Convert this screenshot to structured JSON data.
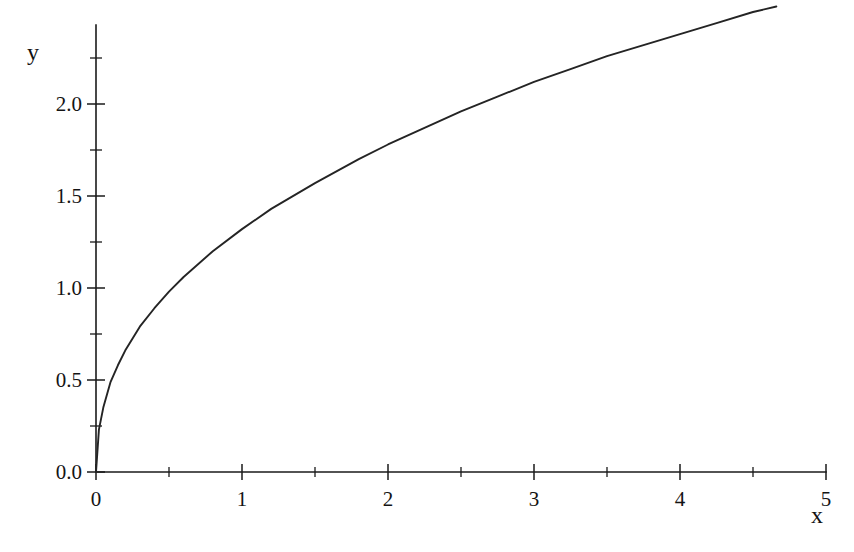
{
  "chart_data": {
    "type": "line",
    "title": "",
    "subtitle": "",
    "xlabel": "x",
    "ylabel": "y",
    "xlim": [
      0,
      5
    ],
    "ylim": [
      0,
      2.45
    ],
    "grid": false,
    "legend": null,
    "x_ticks_major": [
      0,
      1,
      2,
      3,
      4,
      5
    ],
    "x_tick_labels": [
      "0",
      "1",
      "2",
      "3",
      "4",
      "5"
    ],
    "x_ticks_minor": [
      0.5,
      1.5,
      2.5,
      3.5,
      4.5
    ],
    "y_ticks_major": [
      0.0,
      0.5,
      1.0,
      1.5,
      2.0
    ],
    "y_tick_labels": [
      "0.0",
      "0.5",
      "1.0",
      "1.5",
      "2.0"
    ],
    "y_ticks_minor": [
      0.25,
      0.75,
      1.25,
      1.75,
      2.25
    ],
    "series": [
      {
        "name": "curve",
        "color": "#242424",
        "x": [
          0.0,
          0.02,
          0.05,
          0.1,
          0.15,
          0.2,
          0.3,
          0.4,
          0.5,
          0.6,
          0.8,
          1.0,
          1.2,
          1.5,
          1.8,
          2.0,
          2.25,
          2.5,
          2.75,
          3.0,
          3.25,
          3.5,
          3.75,
          4.0,
          4.25,
          4.5,
          4.66
        ],
        "y": [
          0.0,
          0.23,
          0.35,
          0.49,
          0.58,
          0.66,
          0.79,
          0.89,
          0.98,
          1.06,
          1.2,
          1.32,
          1.43,
          1.57,
          1.7,
          1.78,
          1.87,
          1.96,
          2.04,
          2.12,
          2.19,
          2.26,
          2.32,
          2.38,
          2.44,
          2.5,
          2.53
        ]
      }
    ],
    "annotations": []
  },
  "axis_labels": {
    "y_axis_name": "y",
    "x_axis_name": "x"
  },
  "colors": {
    "background": "#ffffff",
    "axis": "#1a1a1a",
    "curve": "#242424",
    "text": "#141414"
  }
}
